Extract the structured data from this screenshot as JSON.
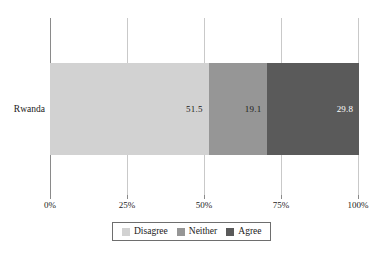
{
  "chart_data": {
    "type": "bar",
    "orientation": "horizontal",
    "stacked": true,
    "normalized_percent": true,
    "title": "",
    "subtitle": "",
    "xlabel": "",
    "ylabel": "",
    "categories": [
      "Rwanda"
    ],
    "xlim": [
      0,
      100
    ],
    "xticks": [
      0,
      25,
      50,
      75,
      100
    ],
    "xtick_labels": [
      "0%",
      "25%",
      "50%",
      "75%",
      "100%"
    ],
    "grid": true,
    "grid_axis": "x",
    "legend_position": "bottom",
    "series": [
      {
        "name": "Disagree",
        "values": [
          51.5
        ],
        "label_text": "51.5",
        "color": "#d2d2d2",
        "label_color": "#1a1a1a"
      },
      {
        "name": "Neither",
        "values": [
          19.1
        ],
        "label_text": "19.1",
        "color": "#969696",
        "label_color": "#1a1a1a"
      },
      {
        "name": "Agree",
        "values": [
          29.8
        ],
        "label_text": "29.8",
        "color": "#5a5a5a",
        "label_color": "#ffffff"
      }
    ]
  },
  "axis": {
    "ticks": [
      {
        "label": "0%",
        "value": 0
      },
      {
        "label": "25%",
        "value": 25
      },
      {
        "label": "50%",
        "value": 50
      },
      {
        "label": "75%",
        "value": 75
      },
      {
        "label": "100%",
        "value": 100
      }
    ]
  },
  "legend": {
    "entries": [
      {
        "label": "Disagree",
        "color": "#d2d2d2"
      },
      {
        "label": "Neither",
        "color": "#969696"
      },
      {
        "label": "Agree",
        "color": "#5a5a5a"
      }
    ]
  },
  "caption": {
    "clipped_text": ""
  },
  "colors": {
    "disagree": "#d2d2d2",
    "neither": "#969696",
    "agree": "#5a5a5a",
    "gridline": "#c9c9c9",
    "axis": "#8a8a8a",
    "text": "#1a1a1a",
    "background": "#ffffff"
  }
}
